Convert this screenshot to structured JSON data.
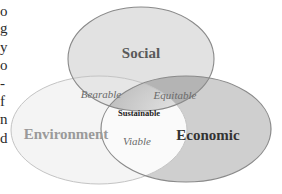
{
  "clipped_paragraph": {
    "fragments": [
      {
        "text": "o",
        "top": 4
      },
      {
        "text": "g",
        "top": 21
      },
      {
        "text": "y",
        "top": 40
      },
      {
        "text": "o",
        "top": 58
      },
      {
        "text": "-",
        "top": 76
      },
      {
        "text": "f",
        "top": 94
      },
      {
        "text": "n",
        "top": 112
      },
      {
        "text": "d",
        "top": 131
      }
    ]
  },
  "diagram": {
    "type": "venn",
    "sets": {
      "social": {
        "label": "Social"
      },
      "environment": {
        "label": "Environment"
      },
      "economic": {
        "label": "Economic"
      }
    },
    "intersections": {
      "social_environment": {
        "label": "Bearable"
      },
      "social_economic": {
        "label": "Equitable"
      },
      "environment_economic": {
        "label": "Viable"
      },
      "all": {
        "label": "Sustainable"
      }
    },
    "colors": {
      "social_fill": "#e2e2e2",
      "environment_fill": "#f4f4f4",
      "economic_fill": "#cfcfcf",
      "equitable_fill": "#b4b4b4",
      "bearable_fill": "#e6e6e6",
      "viable_fill": "#fafafa",
      "center_fill": "#bdbdbd",
      "stroke": "#8a8a8a",
      "env_stroke": "#c4c4c4",
      "social_text": "#5a5a5a",
      "environment_text": "#9a9a9a",
      "economic_text": "#333333",
      "sub_text": "#6a6a6a"
    }
  }
}
